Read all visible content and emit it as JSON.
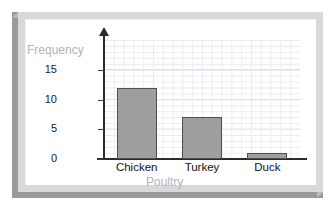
{
  "chart_data": {
    "type": "bar",
    "title": "",
    "categories": [
      "Chicken",
      "Turkey",
      "Duck"
    ],
    "values": [
      12,
      7,
      1
    ],
    "xlabel": "Poultry",
    "ylabel": "Frequency",
    "ylim": [
      0,
      20
    ],
    "yticks": [
      0,
      5,
      10,
      15
    ],
    "ytick_labels": [
      "0",
      "5",
      "10",
      "15"
    ],
    "grid": true,
    "minor_grid": true,
    "legend": "none",
    "series": [
      {
        "name": "Frequency",
        "values": [
          12,
          7,
          1
        ]
      }
    ],
    "colors": {
      "bar_fill": "#9e9e9e",
      "bar_outline": "#4e4e4e",
      "axis": "#2b2b2b",
      "major_grid": "#c9c9d2",
      "minor_grid": "#ececf2",
      "axis_title": "#b3b3b3",
      "tick_label": "#1c1c1c",
      "frame_light": "#d9d9d9",
      "frame_shadow": "#9a9a9a",
      "canvas": "#ffffff"
    }
  }
}
